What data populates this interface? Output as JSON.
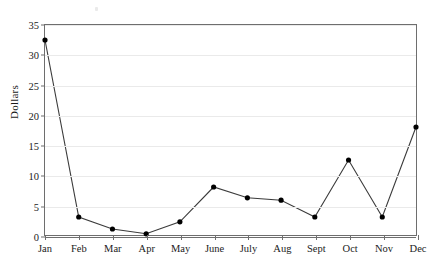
{
  "chart_data": {
    "type": "line",
    "title": "",
    "xlabel": "",
    "ylabel": "Dollars",
    "categories": [
      "Jan",
      "Feb",
      "Mar",
      "Apr",
      "May",
      "June",
      "July",
      "Aug",
      "Sept",
      "Oct",
      "Nov",
      "Dec"
    ],
    "values": [
      32.5,
      3.0,
      1.0,
      0.2,
      2.2,
      8.0,
      6.2,
      5.8,
      3.0,
      12.5,
      3.0,
      18.0
    ],
    "series": [
      {
        "name": "Dollars",
        "values": [
          32.5,
          3.0,
          1.0,
          0.2,
          2.2,
          8.0,
          6.2,
          5.8,
          3.0,
          12.5,
          3.0,
          18.0
        ]
      }
    ],
    "ylim": [
      0,
      35
    ],
    "yticks": [
      0,
      5,
      10,
      15,
      20,
      25,
      30,
      35
    ],
    "ytick_labels": [
      "0",
      "5",
      "10",
      "15",
      "20",
      "25",
      "30",
      "35"
    ],
    "xlim_categories": [
      "Jan",
      "Dec"
    ],
    "grid": "horizontal",
    "legend": "none",
    "marker": "filled-circle",
    "line_color": "#3b3b3b",
    "marker_color": "#000000",
    "grid_color": "#eaeaea",
    "axis_color": "#6e6e6e",
    "background": "#ffffff"
  }
}
